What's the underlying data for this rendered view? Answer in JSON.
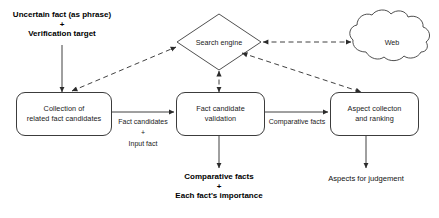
{
  "diagram": {
    "colors": {
      "stroke": "#3c3c3c",
      "text": "#1a1a1a",
      "background": "#ffffff"
    },
    "input": {
      "line1": "Uncertain fact (as phrase)",
      "plus": "+",
      "line2": "Verification target"
    },
    "nodes": {
      "search_engine": "Search engine",
      "web": "Web",
      "collection": {
        "line1": "Collection of",
        "line2": "related fact candidates"
      },
      "validation": {
        "line1": "Fact candidate",
        "line2": "validation"
      },
      "aspect": {
        "line1": "Aspect collecton",
        "line2": "and ranking"
      }
    },
    "edge_labels": {
      "fact_candidates": {
        "line1": "Fact candidates",
        "plus": "+",
        "line2": "Input fact"
      },
      "comparative_facts": "Comparative facts"
    },
    "outputs": {
      "center": {
        "line1": "Comparative facts",
        "plus": "+",
        "line2": "Each fact's importance"
      },
      "right": "Aspects for judgement"
    }
  }
}
